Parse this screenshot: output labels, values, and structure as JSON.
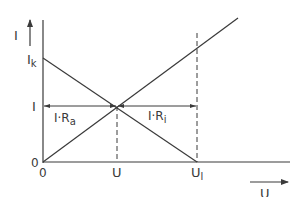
{
  "diagram": {
    "type": "current-voltage characteristic",
    "axes": {
      "y_label": "I",
      "x_label": "U",
      "origin_y_label": "0",
      "origin_x_label": "0"
    },
    "y_ticks": [
      {
        "label": "I",
        "sub": "k",
        "name": "short-circuit-current"
      },
      {
        "label": "I",
        "sub": "",
        "name": "operating-current"
      }
    ],
    "x_ticks": [
      {
        "label": "U",
        "sub": "",
        "name": "operating-voltage"
      },
      {
        "label": "U",
        "sub": "l",
        "name": "open-circuit-voltage"
      }
    ],
    "annotations": {
      "left_segment": {
        "main": "I·R",
        "sub": "a"
      },
      "right_segment": {
        "main": "I·R",
        "sub": "i"
      }
    },
    "colors": {
      "line": "#3a3a3a",
      "background": "#ffffff"
    }
  }
}
